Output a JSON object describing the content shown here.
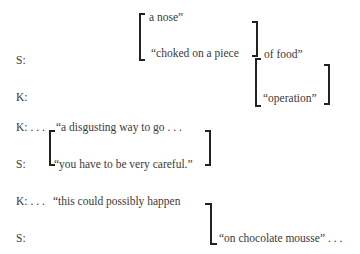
{
  "transcript": {
    "block1": {
      "speaker_s": "S:",
      "speaker_k": "K:",
      "overlap_top": "a nose”",
      "overlap_bottom": "“choked on a piece",
      "continuation_top": "of food”",
      "continuation_bottom": "“operation”"
    },
    "block2": {
      "speaker_k": "K: . . .",
      "speaker_s": "S:",
      "line_k": "“a disgusting way to go . . .",
      "line_s": "“you have to be very careful.”"
    },
    "block3": {
      "speaker_k": "K: . . .",
      "speaker_s": "S:",
      "line_k": "“this could possibly happen",
      "line_s": "“on chocolate mousse” . . ."
    }
  }
}
